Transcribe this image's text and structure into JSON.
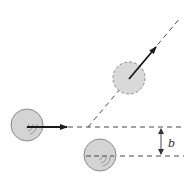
{
  "diagram": {
    "colors": {
      "background": "#ffffff",
      "ball_fill": "#d4d4d4",
      "ball_stroke": "#8a8a8a",
      "line": "#333333",
      "arrow": "#1a1a1a"
    },
    "incoming_ball": {
      "cx": 27,
      "cy": 125,
      "r": 16,
      "outline": "solid"
    },
    "incoming_arrow": {
      "x1": 27,
      "y1": 127,
      "x2": 67,
      "y2": 127
    },
    "scattered_ball": {
      "cx": 129,
      "cy": 78,
      "r": 16,
      "outline": "dashed"
    },
    "scattered_arrow": {
      "x1": 129,
      "y1": 79,
      "x2": 156,
      "y2": 47
    },
    "target_ball": {
      "cx": 100,
      "cy": 155,
      "r": 16,
      "outline": "solid"
    },
    "incident_line": {
      "x1": 68,
      "y1": 127,
      "x2": 184,
      "y2": 127
    },
    "target_line": {
      "x1": 84,
      "y1": 156,
      "x2": 184,
      "y2": 156
    },
    "deflected_line": {
      "x1": 88,
      "y1": 127,
      "x2": 181,
      "y2": 17
    },
    "impact_parameter": {
      "label": "b",
      "x": 161,
      "y_top": 127,
      "y_bottom": 156,
      "label_x": 168,
      "label_y": 147
    }
  }
}
